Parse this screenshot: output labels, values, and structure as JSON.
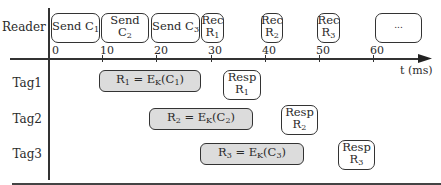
{
  "diagram": {
    "rows": [
      {
        "id": "reader",
        "label": "Reader"
      },
      {
        "id": "tag1",
        "label": "Tag1"
      },
      {
        "id": "tag2",
        "label": "Tag2"
      },
      {
        "id": "tag3",
        "label": "Tag3"
      }
    ],
    "axis": {
      "label": "t (ms)",
      "ticks": [
        "0",
        "10",
        "20",
        "30",
        "40",
        "50",
        "60"
      ]
    },
    "reader_boxes": [
      {
        "main": "Send C",
        "sub": "1"
      },
      {
        "main": "Send C",
        "sub": "2"
      },
      {
        "main": "Send C",
        "sub": "3"
      },
      {
        "main": "Rec",
        "line2": "R",
        "sub": "1"
      },
      {
        "main": "Rec",
        "line2": "R",
        "sub": "2"
      },
      {
        "main": "Rec",
        "line2": "R",
        "sub": "3"
      },
      {
        "main": "..."
      }
    ],
    "compute_boxes": [
      {
        "r": "R",
        "r_sub": "1",
        "eq": " = E",
        "k": "K",
        "c": "(C",
        "c_sub": "1",
        "close": ")"
      },
      {
        "r": "R",
        "r_sub": "2",
        "eq": " = E",
        "k": "K",
        "c": "(C",
        "c_sub": "2",
        "close": ")"
      },
      {
        "r": "R",
        "r_sub": "3",
        "eq": " = E",
        "k": "K",
        "c": "(C",
        "c_sub": "3",
        "close": ")"
      }
    ],
    "resp_boxes": [
      {
        "main": "Resp",
        "line2": "R",
        "sub": "1"
      },
      {
        "main": "Resp",
        "line2": "R",
        "sub": "2"
      },
      {
        "main": "Resp",
        "line2": "R",
        "sub": "3"
      }
    ]
  }
}
